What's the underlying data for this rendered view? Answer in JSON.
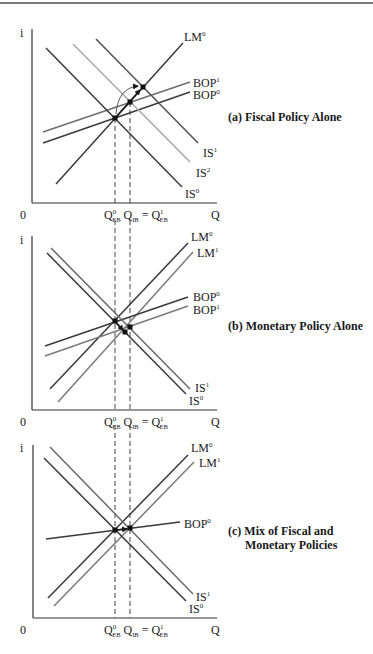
{
  "figure": {
    "panels": [
      {
        "id": "a",
        "title_lines": [
          "(a) Fiscal Policy Alone"
        ],
        "title_pos": [
          228,
          121
        ],
        "axis": {
          "x0": 32,
          "ytop": 29,
          "ybottom": 203,
          "xright": 217,
          "origin_label": "0",
          "y_label": "i",
          "x_label": "Q",
          "i_pos": [
            20,
            37
          ],
          "zero_pos": [
            20,
            219
          ],
          "q_pos": [
            211,
            219
          ]
        },
        "q_labels": {
          "y": 219,
          "x": 104
        },
        "dashed": [
          {
            "x": 115,
            "y1": 118,
            "y2": 203
          },
          {
            "x": 130,
            "y1": 102,
            "y2": 203
          }
        ],
        "curves": [
          {
            "name": "LM",
            "sup": "0",
            "x1": 56,
            "y1": 184,
            "x2": 183,
            "y2": 43,
            "color": "#3a3a3a",
            "label_pos": [
              184,
              41
            ]
          },
          {
            "name": "BOP",
            "sup": "1",
            "x1": 43,
            "y1": 132,
            "x2": 190,
            "y2": 82,
            "color": "#6e6e6e",
            "label_pos": [
              193,
              87
            ]
          },
          {
            "name": "BOP",
            "sup": "0",
            "x1": 43,
            "y1": 143,
            "x2": 190,
            "y2": 92,
            "color": "#3a3a3a",
            "label_pos": [
              193,
              99
            ]
          },
          {
            "name": "IS",
            "sup": "1",
            "x1": 96,
            "y1": 39,
            "x2": 198,
            "y2": 143,
            "color": "#505050",
            "label_pos": [
              203,
              157
            ]
          },
          {
            "name": "IS",
            "sup": "2",
            "x1": 73,
            "y1": 44,
            "x2": 190,
            "y2": 162,
            "color": "#a8a8a8",
            "label_pos": [
              196,
              177
            ]
          },
          {
            "name": "IS",
            "sup": "0",
            "x1": 46,
            "y1": 48,
            "x2": 182,
            "y2": 187,
            "color": "#3a3a3a",
            "label_pos": [
              185,
              198
            ]
          }
        ],
        "points": [
          [
            115,
            118
          ],
          [
            130,
            102
          ],
          [
            143,
            87
          ]
        ],
        "arrows": [
          {
            "type": "straight",
            "x1": 115,
            "y1": 118,
            "x2": 140,
            "y2": 90
          },
          {
            "type": "arc",
            "d": "M 116 114 Q 118 88 138 86"
          }
        ]
      },
      {
        "id": "b",
        "title_lines": [
          "(b) Monetary Policy Alone"
        ],
        "title_pos": [
          228,
          330
        ],
        "axis": {
          "x0": 32,
          "ytop": 236,
          "ybottom": 410,
          "xright": 217,
          "origin_label": "0",
          "y_label": "i",
          "x_label": "Q",
          "i_pos": [
            20,
            244
          ],
          "zero_pos": [
            20,
            426
          ],
          "q_pos": [
            211,
            426
          ]
        },
        "q_labels": {
          "y": 426,
          "x": 104
        },
        "dashed": [
          {
            "x": 115,
            "y1": 220,
            "y2": 410
          },
          {
            "x": 130,
            "y1": 220,
            "y2": 410
          }
        ],
        "curves": [
          {
            "name": "LM",
            "sup": "0",
            "x1": 50,
            "y1": 389,
            "x2": 188,
            "y2": 243,
            "color": "#3a3a3a",
            "label_pos": [
              191,
              241
            ]
          },
          {
            "name": "LM",
            "sup": "1",
            "x1": 58,
            "y1": 402,
            "x2": 193,
            "y2": 252,
            "color": "#7a7a7a",
            "label_pos": [
              197,
              257
            ]
          },
          {
            "name": "BOP",
            "sup": "0",
            "x1": 45,
            "y1": 346,
            "x2": 188,
            "y2": 297,
            "color": "#3a3a3a",
            "label_pos": [
              193,
              301
            ]
          },
          {
            "name": "BOP",
            "sup": "1",
            "x1": 45,
            "y1": 356,
            "x2": 188,
            "y2": 306,
            "color": "#7a7a7a",
            "label_pos": [
              193,
              314
            ]
          },
          {
            "name": "IS",
            "sup": "1",
            "x1": 51,
            "y1": 248,
            "x2": 190,
            "y2": 389,
            "color": "#6a6a6a",
            "label_pos": [
              195,
              392
            ]
          },
          {
            "name": "IS",
            "sup": "0",
            "x1": 47,
            "y1": 253,
            "x2": 186,
            "y2": 394,
            "color": "#3a3a3a",
            "label_pos": [
              189,
              405
            ]
          }
        ],
        "points": [
          [
            115,
            321
          ],
          [
            130,
            327
          ],
          [
            125,
            332
          ]
        ],
        "arrows": [
          {
            "type": "straight",
            "x1": 115,
            "y1": 321,
            "x2": 123,
            "y2": 330
          }
        ]
      },
      {
        "id": "c",
        "title_lines": [
          "(c) Mix of Fiscal and",
          "Monetary Policies"
        ],
        "title_pos": [
          228,
          535
        ],
        "title_indent": 17,
        "axis": {
          "x0": 33,
          "ytop": 445,
          "ybottom": 618,
          "xright": 217,
          "origin_label": "0",
          "y_label": "i",
          "x_label": "Q",
          "i_pos": [
            20,
            452
          ],
          "zero_pos": [
            20,
            634
          ],
          "q_pos": [
            211,
            634
          ]
        },
        "q_labels": {
          "y": 634,
          "x": 104
        },
        "dashed": [
          {
            "x": 115,
            "y1": 425,
            "y2": 618
          },
          {
            "x": 130,
            "y1": 425,
            "y2": 618
          }
        ],
        "curves": [
          {
            "name": "LM",
            "sup": "0",
            "x1": 48,
            "y1": 598,
            "x2": 188,
            "y2": 455,
            "color": "#3a3a3a",
            "label_pos": [
              191,
              452
            ]
          },
          {
            "name": "LM",
            "sup": "1",
            "x1": 54,
            "y1": 606,
            "x2": 194,
            "y2": 462,
            "color": "#7a7a7a",
            "label_pos": [
              199,
              467
            ]
          },
          {
            "name": "BOP",
            "sup": "0",
            "x1": 46,
            "y1": 539,
            "x2": 180,
            "y2": 522,
            "color": "#3a3a3a",
            "label_pos": [
              184,
              528
            ]
          },
          {
            "name": "IS",
            "sup": "1",
            "x1": 50,
            "y1": 447,
            "x2": 193,
            "y2": 594,
            "color": "#6a6a6a",
            "label_pos": [
              196,
              601
            ]
          },
          {
            "name": "IS",
            "sup": "0",
            "x1": 44,
            "y1": 458,
            "x2": 186,
            "y2": 601,
            "color": "#3a3a3a",
            "label_pos": [
              189,
              613
            ]
          }
        ],
        "points": [
          [
            115,
            530
          ],
          [
            130,
            528
          ]
        ],
        "arrows": [
          {
            "type": "straight",
            "x1": 116,
            "y1": 530,
            "x2": 127,
            "y2": 529
          }
        ]
      }
    ],
    "q_label_parts": {
      "q": "Q",
      "eb": "EB",
      "ib": "IB",
      "sup0": "0",
      "sup1": "1",
      "eq": "="
    }
  }
}
